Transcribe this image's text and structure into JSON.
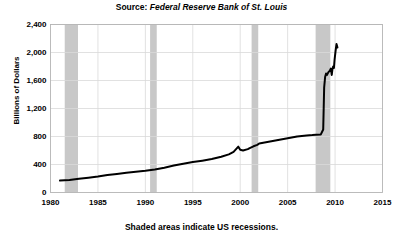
{
  "title": {
    "source_label": "Source:",
    "source_name": "Federal Reserve Bank of St. Louis"
  },
  "footnote": "Shaded areas indicate US recessions.",
  "axis": {
    "ylabel": "Billions of Dollars",
    "xlabel": ""
  },
  "colors": {
    "line": "#000000",
    "recession_band": "#c8c8c8",
    "grid": "#d9d9d9",
    "frame": "#b4b4b4",
    "background": "#ffffff"
  },
  "chart_data": {
    "type": "line",
    "title": "Source: Federal Reserve Bank of St. Louis",
    "xlabel": "",
    "ylabel": "Billions of Dollars",
    "xlim": [
      1980,
      2015
    ],
    "ylim": [
      0,
      2400
    ],
    "xticks": [
      1980,
      1985,
      1990,
      1995,
      2000,
      2005,
      2010,
      2015
    ],
    "xtick_labels": [
      "1980",
      "1985",
      "1990",
      "1995",
      "2000",
      "2005",
      "2010",
      "2015"
    ],
    "yticks": [
      0,
      400,
      800,
      1200,
      1600,
      2000,
      2400
    ],
    "ytick_labels": [
      "0",
      "400",
      "800",
      "1,200",
      "1,600",
      "2,000",
      "2,400"
    ],
    "grid": true,
    "legend": null,
    "series": [
      {
        "name": "Monetary Base",
        "color": "#000000",
        "x": [
          1981.0,
          1982.0,
          1983.0,
          1984.0,
          1985.0,
          1986.0,
          1987.0,
          1988.0,
          1989.0,
          1990.0,
          1991.0,
          1992.0,
          1993.0,
          1994.0,
          1995.0,
          1996.0,
          1997.0,
          1998.0,
          1998.8,
          1999.3,
          1999.8,
          2000.0,
          2000.3,
          2000.8,
          2001.0,
          2001.4,
          2001.8,
          2002.0,
          2003.0,
          2004.0,
          2005.0,
          2006.0,
          2007.0,
          2007.6,
          2008.0,
          2008.5,
          2008.75,
          2008.85,
          2008.95,
          2009.05,
          2009.15,
          2009.3,
          2009.45,
          2009.55,
          2009.65,
          2009.72,
          2009.8,
          2009.88,
          2009.95,
          2010.05,
          2010.15,
          2010.25
        ],
        "y": [
          170,
          180,
          195,
          210,
          228,
          250,
          265,
          282,
          295,
          310,
          330,
          355,
          385,
          412,
          435,
          455,
          478,
          510,
          545,
          580,
          655,
          610,
          600,
          620,
          635,
          660,
          680,
          700,
          725,
          750,
          775,
          800,
          815,
          820,
          825,
          830,
          900,
          1500,
          1650,
          1700,
          1680,
          1720,
          1740,
          1770,
          1680,
          1760,
          1800,
          1780,
          1900,
          2020,
          2120,
          2070
        ]
      }
    ],
    "recessions": [
      {
        "start": 1981.5,
        "end": 1982.9
      },
      {
        "start": 1990.5,
        "end": 1991.2
      },
      {
        "start": 2001.2,
        "end": 2001.9
      },
      {
        "start": 2007.95,
        "end": 2009.5
      }
    ],
    "annotations": [
      "Shaded areas indicate US recessions."
    ]
  }
}
